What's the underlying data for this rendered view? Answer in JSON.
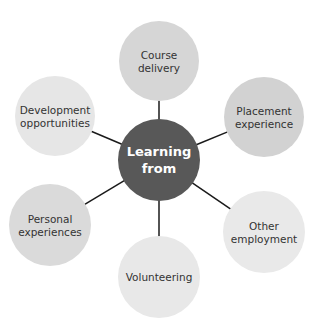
{
  "diagram": {
    "type": "hub-and-spoke",
    "hub": {
      "lines": [
        "Learning",
        "from"
      ],
      "color": "#585858"
    },
    "nodes": [
      {
        "id": "course-delivery",
        "lines": [
          "Course",
          "delivery"
        ],
        "color": "#d6d6d6"
      },
      {
        "id": "placement-experience",
        "lines": [
          "Placement",
          "experience"
        ],
        "color": "#d2d2d2"
      },
      {
        "id": "other-employment",
        "lines": [
          "Other",
          "employment"
        ],
        "color": "#e9e9e9"
      },
      {
        "id": "volunteering",
        "lines": [
          "Volunteering"
        ],
        "color": "#e8e8e8"
      },
      {
        "id": "personal-experiences",
        "lines": [
          "Personal",
          "experiences"
        ],
        "color": "#dadada"
      },
      {
        "id": "development-opportunities",
        "lines": [
          "Development",
          "opportunities"
        ],
        "color": "#e6e6e6"
      }
    ]
  }
}
